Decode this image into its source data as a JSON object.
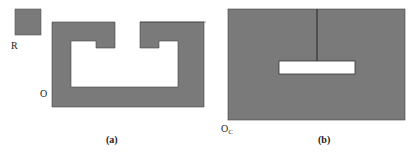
{
  "figure": {
    "panel_a": {
      "robot_label": "R",
      "obstacle_label": "O",
      "caption": "(a)"
    },
    "panel_b": {
      "cspace_label": "O",
      "cspace_subscript": "C",
      "caption": "(b)"
    },
    "colors": {
      "obstacle_fill": "#7a7a7a",
      "free_space": "#ffffff",
      "outline": "#333333"
    }
  }
}
